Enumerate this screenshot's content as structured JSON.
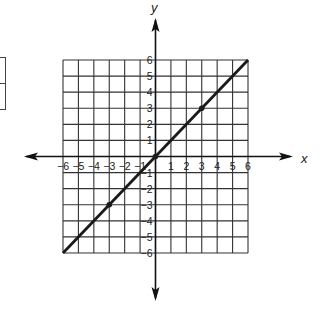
{
  "chart_data": {
    "type": "line",
    "title": "",
    "xlabel": "x",
    "ylabel": "y",
    "xlim": [
      -6,
      6
    ],
    "ylim": [
      -6,
      6
    ],
    "grid": true,
    "x_ticks": [
      -6,
      -5,
      -4,
      -3,
      -2,
      -1,
      1,
      2,
      3,
      4,
      5,
      6
    ],
    "y_ticks": [
      -6,
      -5,
      -4,
      -3,
      -2,
      -1,
      1,
      2,
      3,
      4,
      5,
      6
    ],
    "x_tick_labels": [
      "−6",
      "−5",
      "−4",
      "−3",
      "−2",
      "−1",
      "1",
      "2",
      "3",
      "4",
      "5",
      "6"
    ],
    "y_tick_labels": [
      "−6",
      "−5",
      "−4",
      "−3",
      "−2",
      "−1",
      "1",
      "2",
      "3",
      "4",
      "5",
      "6"
    ],
    "series": [
      {
        "name": "y = x",
        "x": [
          -6,
          6
        ],
        "y": [
          -6,
          6
        ],
        "marked_points": [
          [
            -3,
            -3
          ],
          [
            0,
            0
          ],
          [
            3,
            3
          ]
        ]
      }
    ],
    "line_color": "#1a1a1a",
    "grid_color": "#333333",
    "axis_color": "#111111"
  },
  "labels": {
    "x_axis": "x",
    "y_axis": "y"
  }
}
